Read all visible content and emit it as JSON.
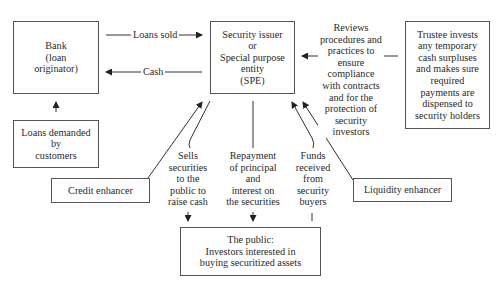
{
  "diagram": {
    "nodes": {
      "bank": {
        "lines": [
          "Bank",
          "(loan",
          "originator)"
        ]
      },
      "loans_demanded": {
        "lines": [
          "Loans demanded",
          "by",
          "customers"
        ]
      },
      "spe": {
        "lines": [
          "Security issuer",
          "or",
          "Special purpose",
          "entity",
          "(SPE)"
        ]
      },
      "trustee": {
        "lines": [
          "Trustee invests",
          "any temporary",
          "cash surpluses",
          "and makes sure",
          "required",
          "payments are",
          "dispensed to",
          "security holders"
        ]
      },
      "credit_enhancer": {
        "lines": [
          "Credit enhancer"
        ]
      },
      "liquidity_enhancer": {
        "lines": [
          "Liquidity enhancer"
        ]
      },
      "public": {
        "lines": [
          "The public:",
          "Investors interested in",
          "buying securitized assets"
        ]
      }
    },
    "edges": {
      "loans_sold": {
        "label": "Loans sold",
        "from": "bank",
        "to": "spe"
      },
      "cash": {
        "label": "Cash",
        "from": "spe",
        "to": "bank"
      },
      "loans_demand": {
        "label": "",
        "from": "loans_demanded",
        "to": "bank"
      },
      "reviews": {
        "lines": [
          "Reviews",
          "procedures and",
          "practices to",
          "ensure",
          "compliance",
          "with contracts",
          "and for the",
          "protection of",
          "security",
          "investors"
        ],
        "from": "trustee",
        "to": "spe"
      },
      "sells": {
        "lines": [
          "Sells",
          "securities",
          "to the",
          "public to",
          "raise cash"
        ],
        "from": "spe",
        "to": "public"
      },
      "repayment": {
        "lines": [
          "Repayment",
          "of principal",
          "and",
          "interest on",
          "the securities"
        ],
        "from": "spe",
        "to": "public"
      },
      "funds": {
        "lines": [
          "Funds",
          "received",
          "from",
          "security",
          "buyers"
        ],
        "from": "public",
        "to": "spe"
      },
      "credit": {
        "label": "",
        "from": "credit_enhancer",
        "to": "spe"
      },
      "liquidity": {
        "label": "",
        "from": "liquidity_enhancer",
        "to": "spe"
      }
    }
  }
}
